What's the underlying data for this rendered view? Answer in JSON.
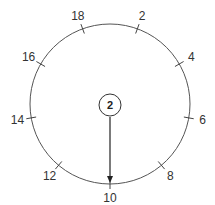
{
  "dial": {
    "center": {
      "x": 110,
      "y": 104
    },
    "radius": 80,
    "stroke_color": "#555555",
    "ticks": [
      {
        "label": "2",
        "angle": 20
      },
      {
        "label": "4",
        "angle": 60
      },
      {
        "label": "6",
        "angle": 100
      },
      {
        "label": "8",
        "angle": 140
      },
      {
        "label": "10",
        "angle": 180
      },
      {
        "label": "12",
        "angle": 220
      },
      {
        "label": "14",
        "angle": 260
      },
      {
        "label": "16",
        "angle": 300
      },
      {
        "label": "18",
        "angle": 340
      }
    ]
  },
  "hub": {
    "label": "2",
    "radius": 11
  },
  "pointer": {
    "points_to": "10",
    "color": "#222222"
  }
}
